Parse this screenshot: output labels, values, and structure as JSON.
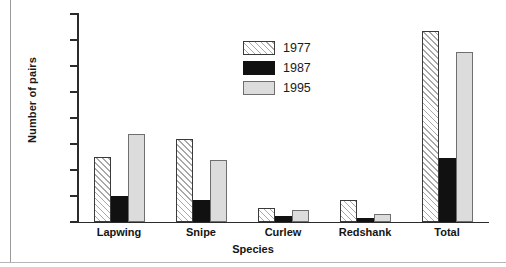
{
  "chart_data": {
    "type": "bar",
    "title": "",
    "xlabel": "Species",
    "ylabel": "Number of pairs",
    "categories": [
      "Lapwing",
      "Snipe",
      "Curlew",
      "Redshank",
      "Total"
    ],
    "series": [
      {
        "name": "1977",
        "values": [
          50,
          64,
          11,
          17,
          147
        ],
        "pattern": "diagonal-hatch",
        "color": "#ffffff"
      },
      {
        "name": "1987",
        "values": [
          20,
          17,
          5,
          3,
          49
        ],
        "pattern": "solid",
        "color": "#111111"
      },
      {
        "name": "1995",
        "values": [
          68,
          48,
          9,
          6,
          131
        ],
        "pattern": "solid",
        "color": "#dcdcdc"
      }
    ],
    "ylim": [
      0,
      160
    ],
    "yticks": [
      0,
      20,
      40,
      60,
      80,
      100,
      120,
      140,
      160
    ],
    "grid": false,
    "legend_position": "upper-center"
  },
  "legend": {
    "entries": [
      {
        "label": "1977"
      },
      {
        "label": "1987"
      },
      {
        "label": "1995"
      }
    ]
  },
  "axes": {
    "y_title": "Number of pairs",
    "x_title": "Species"
  }
}
